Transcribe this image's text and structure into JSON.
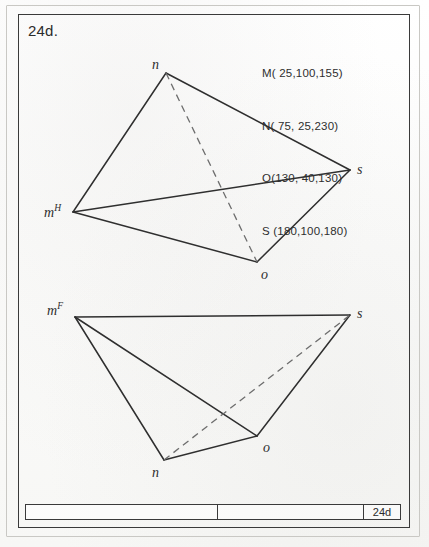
{
  "sheet": {
    "number_label": "24d.",
    "title_block_number": "24d"
  },
  "coordinates": {
    "heading_lines": [
      "M( 25,100,155)",
      "N( 75, 25,230)",
      "O(130, 40,130)",
      "S (180,100,180)"
    ],
    "points": [
      {
        "name": "M",
        "x": 25,
        "y": 100,
        "z": 155
      },
      {
        "name": "N",
        "x": 75,
        "y": 25,
        "z": 230
      },
      {
        "name": "O",
        "x": 130,
        "y": 40,
        "z": 130
      },
      {
        "name": "S",
        "x": 180,
        "y": 100,
        "z": 180
      }
    ]
  },
  "views": {
    "horizontal": {
      "projection_letter": "H",
      "vertices": {
        "m": {
          "label": "m",
          "superscript": "H",
          "px": 73,
          "py": 212,
          "label_x": 44,
          "label_y": 204
        },
        "n": {
          "label": "n",
          "superscript": "",
          "px": 166,
          "py": 73,
          "label_x": 152,
          "label_y": 58
        },
        "o": {
          "label": "o",
          "superscript": "",
          "px": 257,
          "py": 262,
          "label_x": 261,
          "label_y": 268
        },
        "s": {
          "label": "s",
          "superscript": "",
          "px": 350,
          "py": 170,
          "label_x": 357,
          "label_y": 163
        }
      },
      "solid_edges": [
        [
          "m",
          "n"
        ],
        [
          "n",
          "s"
        ],
        [
          "s",
          "o"
        ],
        [
          "o",
          "m"
        ],
        [
          "m",
          "s"
        ]
      ],
      "dashed_edges": [
        [
          "n",
          "o"
        ]
      ]
    },
    "frontal": {
      "projection_letter": "F",
      "vertices": {
        "m": {
          "label": "m",
          "superscript": "F",
          "px": 75,
          "py": 317,
          "label_x": 47,
          "label_y": 302
        },
        "n": {
          "label": "n",
          "superscript": "",
          "px": 164,
          "py": 460,
          "label_x": 152,
          "label_y": 466
        },
        "o": {
          "label": "o",
          "superscript": "",
          "px": 257,
          "py": 436,
          "label_x": 263,
          "label_y": 441
        },
        "s": {
          "label": "s",
          "superscript": "",
          "px": 350,
          "py": 315,
          "label_x": 357,
          "label_y": 307
        }
      },
      "solid_edges": [
        [
          "m",
          "s"
        ],
        [
          "m",
          "n"
        ],
        [
          "m",
          "o"
        ],
        [
          "n",
          "o"
        ],
        [
          "o",
          "s"
        ]
      ],
      "dashed_edges": [
        [
          "n",
          "s"
        ]
      ]
    }
  },
  "style": {
    "line_color": "#2f2f2f",
    "dashed_color": "#6d6d6d",
    "border_color": "#3a3a3a",
    "paper_color": "#fdfdfc"
  }
}
